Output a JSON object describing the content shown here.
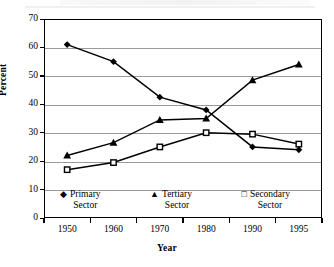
{
  "chart_data": {
    "type": "line",
    "title": "",
    "xlabel": "Year",
    "ylabel": "Percent",
    "categories": [
      "1950",
      "1960",
      "1970",
      "1980",
      "1990",
      "1995"
    ],
    "ylim": [
      0,
      70
    ],
    "ytick_labels": [
      "0",
      "10",
      "20",
      "30",
      "40",
      "50",
      "60",
      "70"
    ],
    "ytick_values": [
      0,
      10,
      20,
      30,
      40,
      50,
      60,
      70
    ],
    "ytick_step": 10,
    "grid": "horizontal",
    "legend_position": "inside-bottom",
    "series": [
      {
        "name": "Primary Sector",
        "marker": "filled-diamond",
        "color": "#000000",
        "values": [
          61,
          55,
          42.5,
          38,
          25,
          24
        ]
      },
      {
        "name": "Tertiary Sector",
        "marker": "filled-triangle",
        "color": "#000000",
        "values": [
          22,
          26.5,
          34.5,
          35,
          48.5,
          54
        ]
      },
      {
        "name": "Secondary Sector",
        "marker": "open-square",
        "color": "#000000",
        "values": [
          17,
          19.5,
          25,
          30,
          29.5,
          26
        ]
      }
    ]
  },
  "legend": {
    "entries": [
      {
        "glyph": "◆",
        "glyph_name": "filled-diamond-marker",
        "line1": "Primary",
        "line2": "Sector"
      },
      {
        "glyph": "▲",
        "glyph_name": "filled-triangle-marker",
        "line1": "Tertiary",
        "line2": "Sector"
      },
      {
        "glyph": "□",
        "glyph_name": "open-square-marker",
        "line1": "Secondary",
        "line2": "Sector"
      }
    ]
  },
  "axis": {
    "y_label": "Percent",
    "x_label": "Year"
  }
}
